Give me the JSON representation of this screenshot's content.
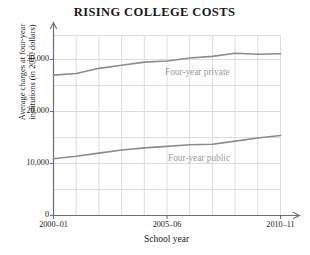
{
  "chart_data": {
    "type": "line",
    "title": "RISING COLLEGE COSTS",
    "xlabel": "School year",
    "ylabel": "Average charges at four-year\ninstitutions (in 2010 dollars)",
    "x": [
      "2000–01",
      "2001–02",
      "2002–03",
      "2003–04",
      "2004–05",
      "2005–06",
      "2006–07",
      "2007–08",
      "2008–09",
      "2009–10",
      "2010–11"
    ],
    "xtick_labels": [
      "2000–01",
      "2005–06",
      "2010–11"
    ],
    "xtick_indices": [
      0,
      5,
      10
    ],
    "ytick_labels": [
      "0",
      "10,000",
      "20,000",
      "30,000"
    ],
    "ytick_values": [
      0,
      10000,
      20000,
      30000
    ],
    "ylim": [
      0,
      35000
    ],
    "grid": true,
    "legend_position": "inline-labels",
    "series": [
      {
        "name": "Four-year private",
        "label": "Four-year private",
        "color": "#8c8c8c",
        "values": [
          27000,
          27300,
          28300,
          28900,
          29500,
          29700,
          30300,
          30600,
          31200,
          31000,
          31100
        ]
      },
      {
        "name": "Four-year public",
        "label": "Four-year public",
        "color": "#8c8c8c",
        "values": [
          10900,
          11400,
          12000,
          12600,
          13000,
          13300,
          13600,
          13700,
          14300,
          14900,
          15400
        ]
      }
    ],
    "colors": {
      "grid": "#d8dee6",
      "axis": "#6e6e6e",
      "line": "#8c8c8c",
      "text": "#171717",
      "series_label": "#9a9a9a"
    }
  }
}
